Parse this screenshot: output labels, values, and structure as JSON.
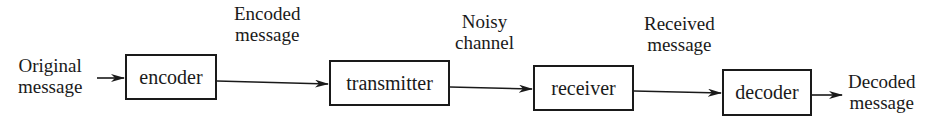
{
  "diagram": {
    "type": "block-flow",
    "blocks": [
      {
        "id": "encoder",
        "label": "encoder"
      },
      {
        "id": "transmitter",
        "label": "transmitter"
      },
      {
        "id": "receiver",
        "label": "receiver"
      },
      {
        "id": "decoder",
        "label": "decoder"
      }
    ],
    "edge_labels": {
      "original": [
        "Original",
        "message"
      ],
      "encoded": [
        "Encoded",
        "message"
      ],
      "noisy": [
        "Noisy",
        "channel"
      ],
      "received": [
        "Received",
        "message"
      ],
      "decoded": [
        "Decoded",
        "message"
      ]
    },
    "colors": {
      "ink": "#1a1a1a",
      "background": "#ffffff"
    }
  }
}
